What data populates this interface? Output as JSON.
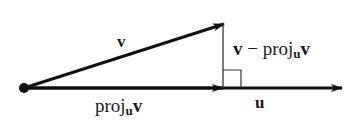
{
  "diagram": {
    "type": "vector-projection",
    "colors": {
      "stroke": "#111111",
      "thin": "#333333",
      "background": "#ffffff"
    },
    "points": {
      "origin": [
        24,
        88
      ],
      "v_tip": [
        224,
        24
      ],
      "proj_tip": [
        223,
        88
      ],
      "u_tip": [
        342,
        88
      ]
    },
    "labels": {
      "v": "v",
      "u": "u",
      "proj": {
        "prefix": "proj",
        "sub": "u",
        "vec": "v"
      },
      "orth": {
        "vec": "v",
        "minus": " − ",
        "prefix": "proj",
        "sub": "u",
        "vec2": "v"
      }
    },
    "right_angle_marker": {
      "x": 223,
      "y": 70,
      "size": 18
    }
  }
}
